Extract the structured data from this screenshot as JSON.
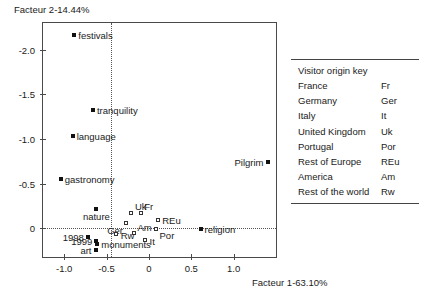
{
  "chart_data": {
    "type": "scatter",
    "title": "",
    "xlabel": "Facteur 1-63.10%",
    "ylabel": "Facteur 2-14.44%",
    "xlim": [
      -1.25,
      1.5
    ],
    "ylim": [
      -2.3,
      0.32
    ],
    "y_axis_inverted": true,
    "xticks": [
      "-1.0",
      "-0.5",
      "0",
      "0.5",
      "1.0"
    ],
    "xtick_values": [
      -1.0,
      -0.5,
      0,
      0.5,
      1.0
    ],
    "yticks": [
      "-2.0",
      "-1.5",
      "-1.0",
      "-0.5",
      "0"
    ],
    "ytick_values": [
      -2.0,
      -1.5,
      -1.0,
      -0.5,
      0
    ],
    "grid": false,
    "reference_lines": [
      {
        "orientation": "horizontal",
        "value": 0,
        "style": "dotted"
      },
      {
        "orientation": "vertical",
        "value": -0.45,
        "style": "dotted"
      }
    ],
    "legend_position": "right-outside-table",
    "series": [
      {
        "name": "Attributes",
        "marker": "filled-square",
        "points": [
          {
            "label": "festivals",
            "x": -0.88,
            "y": -2.17,
            "label_pos": "right"
          },
          {
            "label": "tranquility",
            "x": -0.66,
            "y": -1.33,
            "label_pos": "right"
          },
          {
            "label": "language",
            "x": -0.9,
            "y": -1.03,
            "label_pos": "right"
          },
          {
            "label": "gastronomy",
            "x": -1.04,
            "y": -0.55,
            "label_pos": "right"
          },
          {
            "label": "Pilgrim",
            "x": 1.4,
            "y": -0.74,
            "label_pos": "left"
          },
          {
            "label": "nature",
            "x": -0.62,
            "y": -0.22,
            "label_pos": "bottom"
          },
          {
            "label": "religion",
            "x": 0.61,
            "y": 0.01,
            "label_pos": "right"
          },
          {
            "label": "1998",
            "x": -0.72,
            "y": 0.1,
            "label_pos": "left"
          },
          {
            "label": "1999",
            "x": -0.62,
            "y": 0.14,
            "label_pos": "left"
          },
          {
            "label": "monuments",
            "x": -0.61,
            "y": 0.18,
            "label_pos": "right"
          },
          {
            "label": "art",
            "x": -0.63,
            "y": 0.24,
            "label_pos": "left"
          }
        ]
      },
      {
        "name": "Visitor origins",
        "marker": "open-square",
        "points": [
          {
            "label": "Uk",
            "x": -0.2,
            "y": -0.17,
            "label_pos": "top-right"
          },
          {
            "label": "Fr",
            "x": -0.09,
            "y": -0.17,
            "label_pos": "top-right"
          },
          {
            "label": "REu",
            "x": 0.11,
            "y": -0.09,
            "label_pos": "right"
          },
          {
            "label": "Ger",
            "x": -0.27,
            "y": -0.05,
            "label_pos": "bottom-left"
          },
          {
            "label": "Por",
            "x": 0.09,
            "y": 0.01,
            "label_pos": "bottom-right"
          },
          {
            "label": "Am",
            "x": -0.17,
            "y": 0.06,
            "label_pos": "top-right"
          },
          {
            "label": "Rw",
            "x": -0.38,
            "y": 0.07,
            "label_pos": "right"
          },
          {
            "label": "It",
            "x": -0.04,
            "y": 0.14,
            "label_pos": "right"
          }
        ]
      }
    ]
  },
  "legend": {
    "title": "Visitor origin key",
    "rows": [
      {
        "name": "France",
        "abbr": "Fr"
      },
      {
        "name": "Germany",
        "abbr": "Ger"
      },
      {
        "name": "Italy",
        "abbr": "It"
      },
      {
        "name": "United Kingdom",
        "abbr": "Uk"
      },
      {
        "name": "Portugal",
        "abbr": "Por"
      },
      {
        "name": "Rest of Europe",
        "abbr": "REu"
      },
      {
        "name": "America",
        "abbr": "Am"
      },
      {
        "name": "Rest of the world",
        "abbr": "Rw"
      }
    ]
  }
}
